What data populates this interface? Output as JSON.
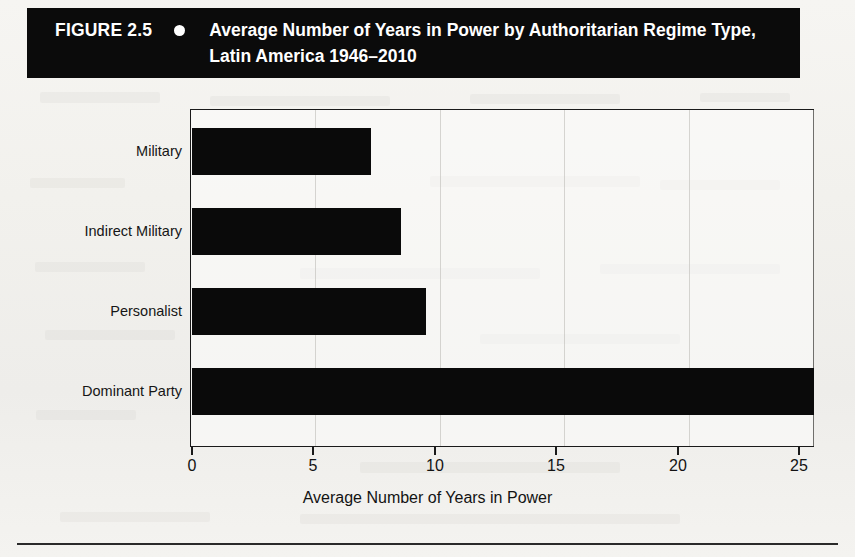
{
  "figure": {
    "number_label": "FIGURE 2.5",
    "bullet": "bullet-dot",
    "title": "Average Number of Years in Power by Authoritarian Regime Type, Latin America 1946–2010"
  },
  "chart_data": {
    "type": "bar",
    "orientation": "horizontal",
    "title": "Average Number of Years in Power by Authoritarian Regime Type, Latin America 1946–2010",
    "categories": [
      "Military",
      "Indirect Military",
      "Personalist",
      "Dominant Party"
    ],
    "values": [
      7.2,
      8.4,
      9.4,
      25.0
    ],
    "xlabel": "Average Number of Years in Power",
    "ylabel": "",
    "xlim": [
      0,
      25
    ],
    "xticks": [
      0,
      5,
      10,
      15,
      20,
      25
    ],
    "xtick_labels": [
      "0",
      "5",
      "10",
      "15",
      "20",
      "25"
    ],
    "grid": true,
    "grid_axis": "x",
    "legend": false,
    "bar_color": "#0a0a0a"
  },
  "colors": {
    "bar": "#0a0a0a",
    "title_bar_background": "#0b0b0b",
    "title_bar_text": "#ffffff",
    "axis": "#1a1a1a",
    "gridline": "#b8b6b1",
    "page_background": "#f3f2ef"
  }
}
